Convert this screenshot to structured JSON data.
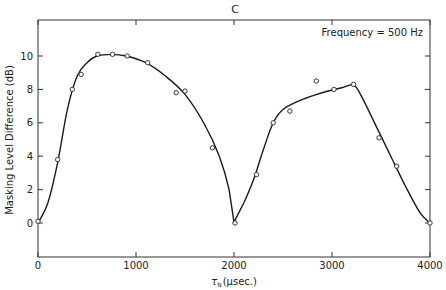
{
  "chart_data": {
    "type": "scatter",
    "title": "C",
    "annotation": "Frequency = 500 Hz",
    "xlabel": "τN (μsec.)",
    "xlabel_main": "τ",
    "xlabel_sub": "N",
    "xlabel_unit": "(μsec.)",
    "ylabel": "Masking Level Difference (dB)",
    "xlim": [
      0,
      4000
    ],
    "ylim": [
      -2,
      12.2
    ],
    "xticks": [
      0,
      1000,
      2000,
      3000,
      4000
    ],
    "yticks": [
      0,
      2,
      4,
      6,
      8,
      10
    ],
    "grid": false,
    "legend": "none",
    "series": [
      {
        "name": "Measured MLD",
        "style": "open-circle markers",
        "x": [
          0,
          200,
          350,
          440,
          610,
          760,
          910,
          1120,
          1410,
          1500,
          1780,
          2010,
          2230,
          2400,
          2570,
          2840,
          3020,
          3220,
          3480,
          3660,
          4000
        ],
        "y": [
          0.1,
          3.8,
          8.0,
          8.9,
          10.1,
          10.1,
          10.0,
          9.6,
          7.8,
          7.9,
          4.5,
          0.0,
          2.9,
          6.0,
          6.7,
          8.5,
          8.0,
          8.3,
          5.1,
          3.4,
          0.0
        ]
      },
      {
        "name": "Fitted curve",
        "style": "smooth solid line",
        "x": [
          0,
          100,
          200,
          300,
          400,
          500,
          600,
          750,
          900,
          1100,
          1300,
          1500,
          1700,
          1850,
          1950,
          2000,
          2100,
          2200,
          2300,
          2400,
          2500,
          2700,
          2900,
          3100,
          3220,
          3300,
          3450,
          3600,
          3750,
          3900,
          4000
        ],
        "y": [
          0.0,
          1.2,
          3.6,
          6.8,
          8.8,
          9.6,
          10.0,
          10.1,
          10.0,
          9.6,
          8.8,
          7.7,
          5.9,
          4.0,
          2.0,
          0.05,
          1.2,
          2.6,
          4.4,
          6.0,
          6.8,
          7.4,
          7.8,
          8.1,
          8.25,
          7.6,
          5.8,
          4.0,
          2.2,
          0.6,
          0.0
        ]
      }
    ]
  }
}
